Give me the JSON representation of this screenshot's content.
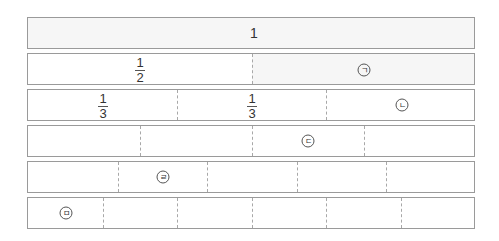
{
  "diagram": {
    "type": "fraction-strips",
    "rows": [
      {
        "denominator": 1,
        "label": "1",
        "markers": []
      },
      {
        "denominator": 2,
        "fraction": {
          "numerator": "1",
          "denominator": "2"
        },
        "markers": [
          {
            "symbol": "ㄱ",
            "position": 2
          }
        ]
      },
      {
        "denominator": 3,
        "fractions": [
          {
            "numerator": "1",
            "denominator": "3"
          },
          {
            "numerator": "1",
            "denominator": "3"
          }
        ],
        "markers": [
          {
            "symbol": "ㄴ",
            "position": 3
          }
        ]
      },
      {
        "denominator": 4,
        "markers": [
          {
            "symbol": "ㄷ",
            "position": 3
          }
        ]
      },
      {
        "denominator": 5,
        "markers": [
          {
            "symbol": "ㄹ",
            "position": 2
          }
        ]
      },
      {
        "denominator": 6,
        "markers": [
          {
            "symbol": "ㅁ",
            "position": 1
          }
        ]
      }
    ]
  },
  "labels": {
    "whole": "1",
    "half_num": "1",
    "half_den": "2",
    "third1_num": "1",
    "third1_den": "3",
    "third2_num": "1",
    "third2_den": "3",
    "marker_a": "ㄱ",
    "marker_b": "ㄴ",
    "marker_c": "ㄷ",
    "marker_d": "ㄹ",
    "marker_e": "ㅁ"
  },
  "colors": {
    "border": "#9a9a9a",
    "shade": "#f6f6f6",
    "divider": "#a8a8a8"
  }
}
